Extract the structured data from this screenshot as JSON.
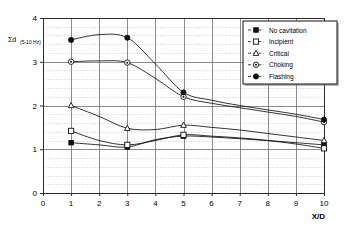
{
  "chart_data": {
    "type": "line",
    "title": "",
    "xlabel": "X/D",
    "ylabel": "Σd",
    "ylabel_sub": "(5-10 Hz)",
    "xlim": [
      0,
      10
    ],
    "ylim": [
      0,
      4
    ],
    "xticks": [
      "0",
      "1",
      "2",
      "3",
      "4",
      "5",
      "6",
      "7",
      "8",
      "9",
      "10"
    ],
    "yticks": [
      "0",
      "1",
      "2",
      "3",
      "4"
    ],
    "grid": true,
    "grid_major": true,
    "grid_minor": true,
    "legend_position": "top-right",
    "x": [
      1,
      2,
      3,
      4,
      5,
      6,
      7,
      8,
      9,
      10
    ],
    "series": [
      {
        "name": "No cavitation",
        "marker": "filled-square",
        "color": "#000000",
        "marker_points_x": [
          1,
          3,
          5,
          10
        ],
        "values": [
          1.15,
          1.1,
          1.05,
          1.22,
          1.3,
          1.28,
          1.24,
          1.2,
          1.15,
          1.1
        ]
      },
      {
        "name": "Incipient",
        "marker": "open-square",
        "color": "#000000",
        "marker_points_x": [
          1,
          3,
          5,
          10
        ],
        "values": [
          1.42,
          1.2,
          1.1,
          1.2,
          1.33,
          1.3,
          1.26,
          1.2,
          1.12,
          1.02
        ]
      },
      {
        "name": "Critical",
        "marker": "open-triangle",
        "color": "#000000",
        "marker_points_x": [
          1,
          3,
          5,
          10
        ],
        "values": [
          2.0,
          1.75,
          1.48,
          1.45,
          1.55,
          1.5,
          1.44,
          1.36,
          1.28,
          1.2
        ]
      },
      {
        "name": "Choking",
        "marker": "circle-dot",
        "color": "#000000",
        "marker_points_x": [
          1,
          3,
          5,
          10
        ],
        "values": [
          3.0,
          3.02,
          2.98,
          2.62,
          2.2,
          2.05,
          1.95,
          1.85,
          1.75,
          1.62
        ]
      },
      {
        "name": "Flashing",
        "marker": "filled-circle",
        "color": "#000000",
        "marker_points_x": [
          1,
          3,
          5,
          10
        ],
        "values": [
          3.5,
          3.62,
          3.55,
          2.95,
          2.3,
          2.12,
          2.0,
          1.9,
          1.8,
          1.68
        ]
      }
    ]
  },
  "legend": {
    "items": [
      {
        "label": "No cavitation",
        "marker": "filled-square"
      },
      {
        "label": "Incipient",
        "marker": "open-square"
      },
      {
        "label": "Critical",
        "marker": "open-triangle"
      },
      {
        "label": "Choking",
        "marker": "circle-dot"
      },
      {
        "label": "Flashing",
        "marker": "filled-circle"
      }
    ]
  }
}
